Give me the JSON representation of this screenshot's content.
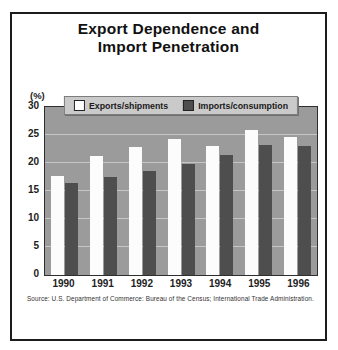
{
  "figure": {
    "title_line1": "Export Dependence and",
    "title_line2": "Import Penetration",
    "source": "Source: U.S. Department of Commerce: Bureau of the Census; International Trade Administration."
  },
  "chart_data": {
    "type": "bar",
    "title": "Export Dependence and Import Penetration",
    "ylabel": "(%)",
    "xlabel": "",
    "categories": [
      "1990",
      "1991",
      "1992",
      "1993",
      "1994",
      "1995",
      "1996"
    ],
    "series": [
      {
        "name": "Exports/shipments",
        "color": "#fcfcfc",
        "values": [
          17.7,
          21.3,
          22.8,
          24.2,
          23.1,
          25.9,
          24.7
        ]
      },
      {
        "name": "Imports/consumption",
        "color": "#4e4e4e",
        "values": [
          16.4,
          17.5,
          18.5,
          19.9,
          21.4,
          23.2,
          23.0
        ]
      }
    ],
    "ylim": [
      0,
      30
    ],
    "yticks": [
      0,
      5,
      10,
      15,
      20,
      25,
      30
    ],
    "grid": true,
    "grid_color": "#c6c6c6",
    "plot_background": "#9b9b9b",
    "legend_position": "top",
    "source_note": "Source: U.S. Department of Commerce: Bureau of the Census; International Trade Administration."
  }
}
